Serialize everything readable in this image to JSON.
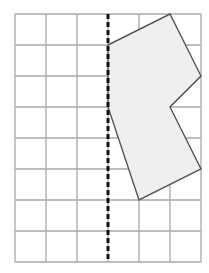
{
  "diagram": {
    "type": "grid-reflection",
    "grid": {
      "columns": 6,
      "rows": 8,
      "origin_x": 15,
      "origin_y": 14,
      "cell": 31,
      "line_color": "#a8a8a8"
    },
    "mirror_line": {
      "column": 3,
      "style": "dashed",
      "color": "#111111"
    },
    "shape": {
      "fill": "#efefef",
      "stroke": "#555555",
      "vertices_grid": [
        [
          3,
          1
        ],
        [
          5,
          0
        ],
        [
          6,
          2
        ],
        [
          5,
          3
        ],
        [
          6,
          5
        ],
        [
          4,
          6
        ],
        [
          3,
          3
        ]
      ]
    }
  }
}
